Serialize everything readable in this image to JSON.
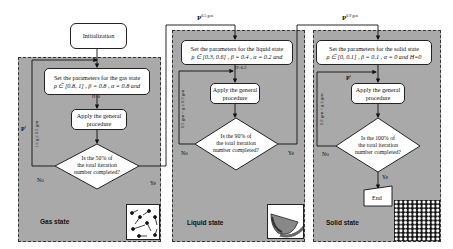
{
  "diagram": {
    "init": {
      "label": "Initialization"
    },
    "transitions": {
      "to_liquid": {
        "label": "P",
        "sup": "0.5 gen"
      },
      "to_solid": {
        "label": "P",
        "sup": "0.9 gen"
      }
    },
    "gas": {
      "state_label": "Gas state",
      "set_params": {
        "line1": "Set the parameters for the gas state",
        "line2": "ρ ∈ [0.8, 1] ,  β = 0.8 ,  α = 0.8  and",
        "line3": "H=0"
      },
      "apply": {
        "line1": "Apply the general",
        "line2": "procedure"
      },
      "decision": {
        "line1": "Is the 50% of",
        "line2": "the total iteration",
        "line3": "number completed?"
      },
      "no_label": "No",
      "yes_label": "Ye",
      "loop_label": "P",
      "loop_sup": "t",
      "loop_range": "1 ≤ g ≤ 0.5 gen",
      "icon": "gas-particles-icon"
    },
    "liquid": {
      "state_label": "Liquid state",
      "set_params": {
        "line1": "Set the parameters for the liquid state",
        "line2": "ρ ∈ [0.3, 0.6] ,  β = 0.4 ,  α = 0.2  and",
        "line3": "H=0.2"
      },
      "apply": {
        "line1": "Apply the general",
        "line2": "procedure"
      },
      "decision": {
        "line1": "Is the 90% of",
        "line2": "the total iteration",
        "line3": "number completed?"
      },
      "no_label": "No",
      "yes_label": "Ye",
      "loop_range": "0.5 gen < g ≤ 0.9 gen",
      "icon": "liquid-bowl-icon"
    },
    "solid": {
      "state_label": "Solid state",
      "set_params": {
        "line1": "Set the parameters for the solid state",
        "line2": "ρ ∈ [0, 0.1] ,  β = 0.1 ,  α = 0  and H=0"
      },
      "apply": {
        "line1": "Apply the general",
        "line2": "procedure"
      },
      "decision": {
        "line1": "Is the 100% of",
        "line2": "the total iteration",
        "line3": "number completed?"
      },
      "no_label": "No",
      "yes_label": "Ye",
      "loop_label": "P",
      "loop_sup": "t",
      "loop_range": "0.9 gen < g ≤ gen",
      "end_label": "End",
      "icon": "solid-lattice-icon"
    }
  }
}
